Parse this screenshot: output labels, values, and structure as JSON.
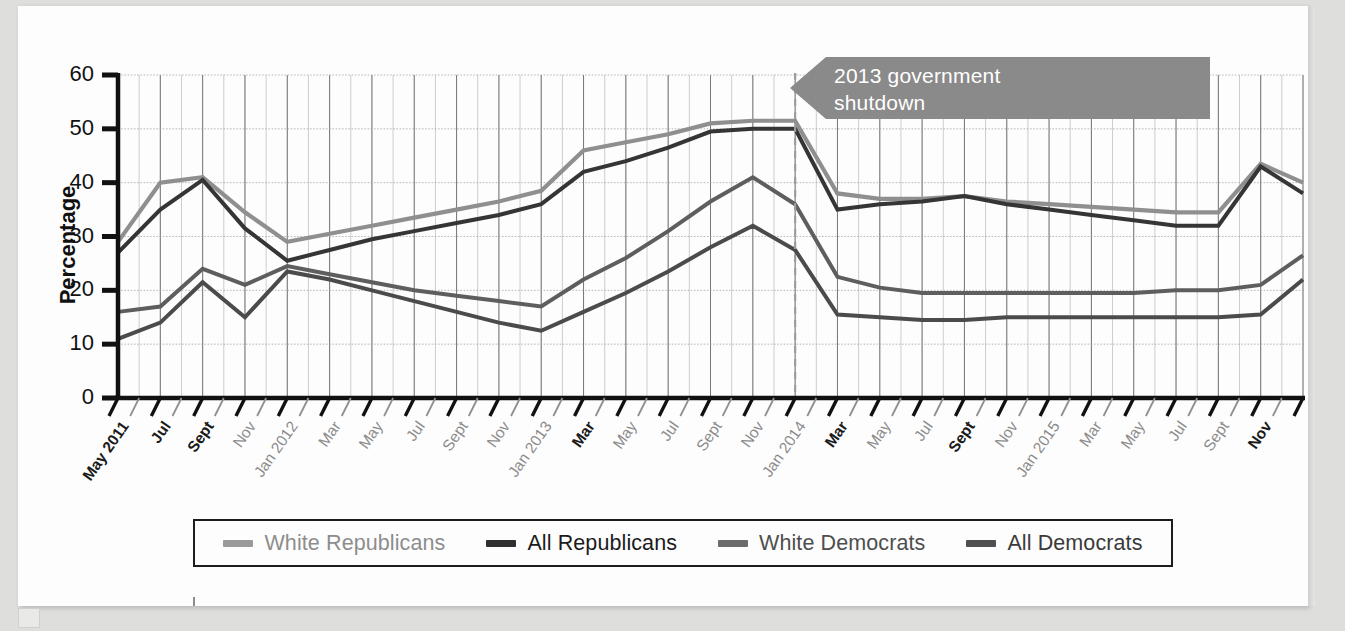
{
  "chart_data": {
    "type": "line",
    "title": "",
    "xlabel": "",
    "ylabel": "Percentage",
    "ylim": [
      0,
      60
    ],
    "yticks": [
      0,
      10,
      20,
      30,
      40,
      50,
      60
    ],
    "grid": true,
    "legend_position": "bottom",
    "x_start": "May 2011",
    "x_end": "Dec 2015",
    "x_tick_labels": [
      {
        "index": 0,
        "label": "May 2011",
        "emphasis": "bold"
      },
      {
        "index": 2,
        "label": "Jul",
        "emphasis": "bold"
      },
      {
        "index": 4,
        "label": "Sept",
        "emphasis": "bold"
      },
      {
        "index": 6,
        "label": "Nov",
        "emphasis": "light"
      },
      {
        "index": 8,
        "label": "Jan 2012",
        "emphasis": "light"
      },
      {
        "index": 10,
        "label": "Mar",
        "emphasis": "light"
      },
      {
        "index": 12,
        "label": "May",
        "emphasis": "light"
      },
      {
        "index": 14,
        "label": "Jul",
        "emphasis": "light"
      },
      {
        "index": 16,
        "label": "Sept",
        "emphasis": "light"
      },
      {
        "index": 18,
        "label": "Nov",
        "emphasis": "light"
      },
      {
        "index": 20,
        "label": "Jan 2013",
        "emphasis": "light"
      },
      {
        "index": 22,
        "label": "Mar",
        "emphasis": "bold"
      },
      {
        "index": 24,
        "label": "May",
        "emphasis": "light"
      },
      {
        "index": 26,
        "label": "Jul",
        "emphasis": "light"
      },
      {
        "index": 28,
        "label": "Sept",
        "emphasis": "light"
      },
      {
        "index": 30,
        "label": "Nov",
        "emphasis": "light"
      },
      {
        "index": 32,
        "label": "Jan 2014",
        "emphasis": "light"
      },
      {
        "index": 34,
        "label": "Mar",
        "emphasis": "bold"
      },
      {
        "index": 36,
        "label": "May",
        "emphasis": "light"
      },
      {
        "index": 38,
        "label": "Jul",
        "emphasis": "light"
      },
      {
        "index": 40,
        "label": "Sept",
        "emphasis": "bold"
      },
      {
        "index": 42,
        "label": "Nov",
        "emphasis": "light"
      },
      {
        "index": 44,
        "label": "Jan 2015",
        "emphasis": "light"
      },
      {
        "index": 46,
        "label": "Mar",
        "emphasis": "light"
      },
      {
        "index": 48,
        "label": "May",
        "emphasis": "light"
      },
      {
        "index": 50,
        "label": "Jul",
        "emphasis": "light"
      },
      {
        "index": 52,
        "label": "Sept",
        "emphasis": "light"
      },
      {
        "index": 54,
        "label": "Nov",
        "emphasis": "bold"
      }
    ],
    "x": [
      0,
      2,
      4,
      6,
      8,
      10,
      12,
      14,
      16,
      18,
      20,
      22,
      24,
      26,
      28,
      30,
      32,
      34,
      36,
      38,
      40,
      42,
      44,
      46,
      48,
      50,
      52,
      54,
      56
    ],
    "series": [
      {
        "name": "White Republicans",
        "color": "#8f8f8f",
        "values": [
          29.0,
          40.0,
          41.0,
          34.5,
          29.0,
          30.5,
          32.0,
          33.5,
          35.0,
          36.5,
          38.5,
          46.0,
          47.5,
          49.0,
          51.0,
          51.5,
          51.5,
          38.0,
          37.0,
          37.0,
          37.5,
          36.5,
          36.0,
          35.5,
          35.0,
          34.5,
          34.5,
          43.5,
          40.0
        ]
      },
      {
        "name": "All Republicans",
        "color": "#353535",
        "values": [
          27.0,
          35.0,
          40.5,
          31.5,
          25.5,
          27.5,
          29.5,
          31.0,
          32.5,
          34.0,
          36.0,
          42.0,
          44.0,
          46.5,
          49.5,
          50.0,
          50.0,
          35.0,
          36.0,
          36.5,
          37.5,
          36.0,
          35.0,
          34.0,
          33.0,
          32.0,
          32.0,
          43.0,
          38.0
        ]
      },
      {
        "name": "White Democrats",
        "color": "#5e5e5e",
        "values": [
          16.0,
          17.0,
          24.0,
          21.0,
          24.5,
          23.0,
          21.5,
          20.0,
          19.0,
          18.0,
          17.0,
          22.0,
          26.0,
          31.0,
          36.5,
          41.0,
          36.0,
          22.5,
          20.5,
          19.5,
          19.5,
          19.5,
          19.5,
          19.5,
          19.5,
          20.0,
          20.0,
          21.0,
          26.5
        ]
      },
      {
        "name": "All Democrats",
        "color": "#4b4b4b",
        "values": [
          11.0,
          14.0,
          21.5,
          15.0,
          23.5,
          22.0,
          20.0,
          18.0,
          16.0,
          14.0,
          12.5,
          16.0,
          19.5,
          23.5,
          28.0,
          32.0,
          27.5,
          15.5,
          15.0,
          14.5,
          14.5,
          15.0,
          15.0,
          15.0,
          15.0,
          15.0,
          15.0,
          15.5,
          22.0
        ]
      }
    ],
    "annotations": [
      {
        "name": "shutdown-callout",
        "text_line_1": "2013 government",
        "text_line_2": "shutdown",
        "marker_x_label": "Jan 2014",
        "marker_style": "dashed vertical line",
        "fill_color": "#8a8a8a"
      }
    ]
  },
  "legend": {
    "items": [
      {
        "label": "White Republicans",
        "color": "#9a9a9a",
        "text_color": "#8d8d8d"
      },
      {
        "label": "All Republicans",
        "color": "#2f2f2f",
        "text_color": "#1b1b1b"
      },
      {
        "label": "White Democrats",
        "color": "#6b6b6b",
        "text_color": "#4e4e4e"
      },
      {
        "label": "All Democrats",
        "color": "#4f4f4f",
        "text_color": "#3a3a3a"
      }
    ]
  }
}
